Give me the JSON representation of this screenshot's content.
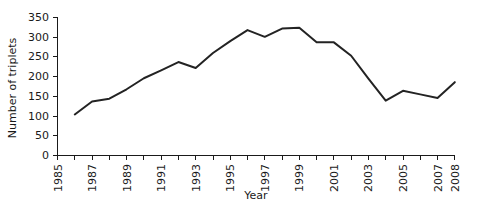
{
  "chart_data": {
    "type": "line",
    "title": "",
    "xlabel": "Year",
    "ylabel": "Number of triplets",
    "xlim": [
      1985,
      2008
    ],
    "ylim": [
      0,
      350
    ],
    "grid": false,
    "legend": false,
    "y_ticks": [
      0,
      50,
      100,
      150,
      200,
      250,
      300,
      350
    ],
    "y_tick_labels": [
      "0",
      "50",
      "100",
      "150",
      "200",
      "250",
      "300",
      "350"
    ],
    "x_ticks": [
      1985,
      1987,
      1989,
      1991,
      1993,
      1995,
      1997,
      1999,
      2001,
      2003,
      2005,
      2007,
      2008
    ],
    "x_tick_labels": [
      "1985",
      "1987",
      "1989",
      "1991",
      "1993",
      "1995",
      "1997",
      "1999",
      "2001",
      "2003",
      "2005",
      "2007",
      "2008"
    ],
    "x_minor_ticks": [
      1986,
      1988,
      1990,
      1992,
      1994,
      1996,
      1998,
      2000,
      2002,
      2004,
      2006
    ],
    "x": [
      1986,
      1987,
      1988,
      1989,
      1990,
      1991,
      1992,
      1993,
      1994,
      1995,
      1996,
      1997,
      1998,
      1999,
      2000,
      2001,
      2002,
      2003,
      2004,
      2005,
      2006,
      2007,
      2008
    ],
    "values": [
      104,
      137,
      144,
      168,
      196,
      216,
      237,
      222,
      260,
      290,
      318,
      301,
      322,
      324,
      287,
      287,
      253,
      195,
      139,
      164,
      155,
      146,
      186
    ],
    "series": [
      {
        "name": "Number of triplets",
        "color": "#232323",
        "values": [
          104,
          137,
          144,
          168,
          196,
          216,
          237,
          222,
          260,
          290,
          318,
          301,
          322,
          324,
          287,
          287,
          253,
          195,
          139,
          164,
          155,
          146,
          186
        ]
      }
    ]
  },
  "axes": {
    "y_title": "Number of triplets",
    "x_title": "Year"
  }
}
